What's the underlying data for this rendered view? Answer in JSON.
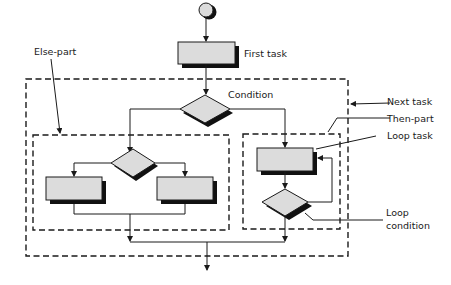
{
  "diagram": {
    "type": "flowchart",
    "labels": {
      "first_task": "First task",
      "else_part": "Else-part",
      "condition": "Condition",
      "next_task": "Next task",
      "then_part": "Then-part",
      "loop_task": "Loop task",
      "loop_condition_line1": "Loop",
      "loop_condition_line2": "condition"
    },
    "nodes": [
      {
        "id": "start",
        "shape": "circle"
      },
      {
        "id": "first_task",
        "shape": "rectangle",
        "label": "First task"
      },
      {
        "id": "condition",
        "shape": "diamond",
        "label": "Condition"
      },
      {
        "id": "else_condition",
        "shape": "diamond"
      },
      {
        "id": "else_task_left",
        "shape": "rectangle"
      },
      {
        "id": "else_task_right",
        "shape": "rectangle"
      },
      {
        "id": "loop_task",
        "shape": "rectangle",
        "label": "Loop task"
      },
      {
        "id": "loop_condition",
        "shape": "diamond",
        "label": "Loop condition"
      }
    ],
    "groups": [
      {
        "id": "next_task",
        "label": "Next task",
        "style": "dashed"
      },
      {
        "id": "else_part",
        "label": "Else-part",
        "style": "dashed"
      },
      {
        "id": "then_part",
        "label": "Then-part",
        "style": "dashed"
      }
    ],
    "colors": {
      "node_fill": "#dcdcdc",
      "shadow": "#111111",
      "stroke": "#1a1a1a",
      "background": "#ffffff"
    }
  }
}
